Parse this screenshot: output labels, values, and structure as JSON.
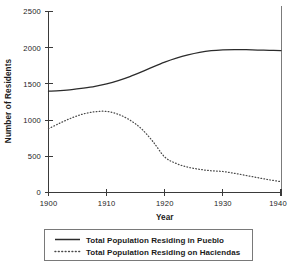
{
  "chart_data": {
    "type": "line",
    "title": "",
    "xlabel": "Year",
    "ylabel": "Number of Residents",
    "xlim": [
      1900,
      1940
    ],
    "ylim": [
      0,
      2500
    ],
    "grid": false,
    "legend_position": "bottom",
    "x_ticks": [
      1900,
      1910,
      1920,
      1930,
      1940
    ],
    "x_tick_labels": [
      "1900",
      "1910",
      "1920",
      "1930",
      "1940"
    ],
    "y_ticks": [
      0,
      500,
      1000,
      1500,
      2000,
      2500
    ],
    "y_tick_labels": [
      "0",
      "500",
      "1000",
      "1500",
      "2000",
      "2500"
    ],
    "x": [
      1900,
      1902,
      1904,
      1906,
      1908,
      1910,
      1912,
      1914,
      1916,
      1918,
      1920,
      1922,
      1924,
      1926,
      1928,
      1930,
      1932,
      1934,
      1936,
      1938,
      1940
    ],
    "series": [
      {
        "name": "Total Population Residing in Pueblo",
        "style": "solid",
        "color": "#2b2b2b",
        "values": [
          1400,
          1408,
          1420,
          1440,
          1465,
          1500,
          1545,
          1600,
          1665,
          1735,
          1800,
          1855,
          1900,
          1935,
          1958,
          1970,
          1975,
          1972,
          1968,
          1963,
          1960
        ]
      },
      {
        "name": "Total Population Residing on Haciendas",
        "style": "dotted",
        "color": "#4a4a4a",
        "values": [
          880,
          960,
          1030,
          1085,
          1115,
          1120,
          1080,
          1000,
          880,
          700,
          490,
          400,
          350,
          320,
          300,
          290,
          265,
          235,
          205,
          175,
          150
        ]
      }
    ],
    "legend": [
      {
        "label": "Total Population Residing in Pueblo",
        "style": "solid"
      },
      {
        "label": "Total Population Residing on Haciendas",
        "style": "dotted"
      }
    ]
  }
}
